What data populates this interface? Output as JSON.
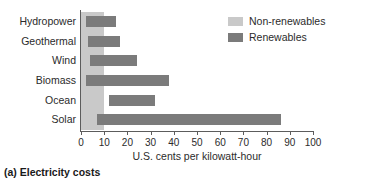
{
  "caption": "(a) Electricity costs",
  "legend": {
    "items": [
      {
        "label": "Non-renewables",
        "color": "#c9c9c9",
        "name": "non-renewables"
      },
      {
        "label": "Renewables",
        "color": "#7b7b7b",
        "name": "renewables"
      }
    ]
  },
  "chart_data": {
    "type": "bar",
    "orientation": "horizontal",
    "title": "",
    "xlabel": "U.S. cents per kilowatt-hour",
    "ylabel": "",
    "xlim": [
      0,
      100
    ],
    "xticks": [
      0,
      10,
      20,
      30,
      40,
      50,
      60,
      70,
      80,
      90,
      100
    ],
    "xtick_labels": [
      "0",
      "10",
      "20",
      "30",
      "40",
      "50",
      "60",
      "70",
      "80",
      "90",
      "100"
    ],
    "grid": false,
    "legend_position": "top-right",
    "categories": [
      "Hydropower",
      "Geothermal",
      "Wind",
      "Biomass",
      "Ocean",
      "Solar"
    ],
    "series": [
      {
        "name": "Non-renewables",
        "color": "#c9c9c9",
        "type": "range-band",
        "note": "Shaded reference band spanning full chart height",
        "range": [
          0,
          10
        ]
      },
      {
        "name": "Renewables",
        "color": "#7b7b7b",
        "type": "range-bars",
        "ranges": [
          {
            "category": "Hydropower",
            "start": 2,
            "end": 15
          },
          {
            "category": "Geothermal",
            "start": 3,
            "end": 17
          },
          {
            "category": "Wind",
            "start": 4,
            "end": 24
          },
          {
            "category": "Biomass",
            "start": 2,
            "end": 38
          },
          {
            "category": "Ocean",
            "start": 12,
            "end": 32
          },
          {
            "category": "Solar",
            "start": 7,
            "end": 86
          }
        ]
      }
    ]
  }
}
